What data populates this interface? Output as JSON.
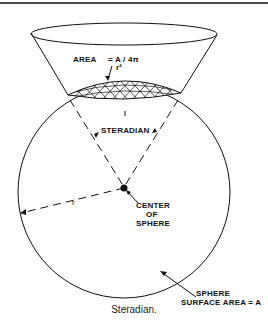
{
  "figure": {
    "caption": "Steradian.",
    "labels": {
      "area_word": "AREA",
      "area_formula": "= A / 4π",
      "area_r2": "r²",
      "steradian": "STERADIAN",
      "radius": "r",
      "center_line1": "CENTER",
      "center_line2": "OF",
      "center_line3": "SPHERE",
      "surface_line1": "SPHERE",
      "surface_line2": "SURFACE   AREA = A"
    },
    "colors": {
      "ink": "#111111",
      "background": "#ffffff"
    }
  }
}
